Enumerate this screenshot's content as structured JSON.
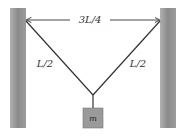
{
  "diagram": {
    "width_label": "3L/4",
    "left_string_label": "L/2",
    "right_string_label": "L/2",
    "mass_label": "m",
    "colors": {
      "wall": "#8a8a8a",
      "string": "#333333",
      "mass": "#9a9a9a",
      "background": "#ffffff"
    }
  }
}
